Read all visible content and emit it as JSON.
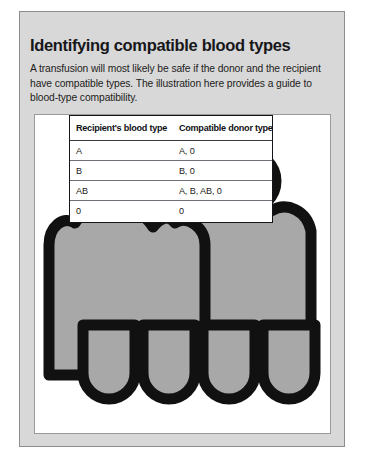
{
  "card": {
    "heading": "Identifying compatible blood types",
    "intro": "A transfusion will most likely be safe if the donor and the recipient have compatible types. The illustration here provides a guide to blood-type compatibility."
  },
  "illustration": {
    "alt_name": "two-people-figures-illustration",
    "figure_fill": "#a8a8a8",
    "figure_outline": "#111111",
    "panel_background": "#ffffff"
  },
  "table": {
    "headers": [
      "Recipient's blood type",
      "Compatible donor type"
    ],
    "rows": [
      {
        "recipient": "A",
        "donor": "A, 0"
      },
      {
        "recipient": "B",
        "donor": "B, 0"
      },
      {
        "recipient": "AB",
        "donor": "A, B, AB, 0"
      },
      {
        "recipient": "0",
        "donor": "0"
      }
    ]
  },
  "colors": {
    "card_background": "#d8d8d8",
    "card_border": "#8d8d8d",
    "text": "#17171a",
    "page_background": "#ffffff"
  }
}
